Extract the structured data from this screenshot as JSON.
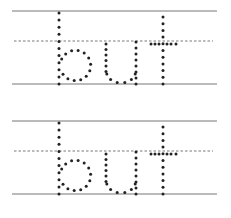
{
  "worksheet": {
    "word": "but",
    "rows": [
      {
        "word": "but",
        "top_y": 11,
        "mid_y": 41,
        "base_y": 84
      },
      {
        "word": "but",
        "top_y": 121,
        "mid_y": 151,
        "base_y": 194
      }
    ],
    "line_x_start": 12,
    "line_x_end": 217
  },
  "colors": {
    "solid_line": "#777777",
    "dashed_line": "#555555",
    "dots": "#222222",
    "background": "#ffffff"
  }
}
